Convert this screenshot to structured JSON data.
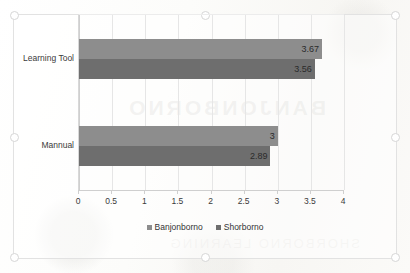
{
  "chart_data": {
    "type": "bar",
    "orientation": "horizontal",
    "title": "",
    "xlabel": "",
    "ylabel": "",
    "categories": [
      "Learning Tool",
      "Mannual"
    ],
    "series": [
      {
        "name": "Banjonborno",
        "values": [
          3.67,
          3
        ],
        "value_labels": [
          "3.67",
          "3"
        ],
        "color": "#8d8d8d"
      },
      {
        "name": "Shorborno",
        "values": [
          3.56,
          2.89
        ],
        "value_labels": [
          "3.56",
          "2.89"
        ],
        "color": "#6e6e6e"
      }
    ],
    "xlim": [
      0,
      4
    ],
    "xticks": [
      0,
      0.5,
      1,
      1.5,
      2,
      2.5,
      3,
      3.5,
      4
    ],
    "xtick_labels": [
      "0",
      "0.5",
      "1",
      "1.5",
      "2",
      "2.5",
      "3",
      "3.5",
      "4"
    ],
    "grid": true,
    "grid_axis": "x",
    "legend_position": "bottom"
  },
  "legend": {
    "items": [
      {
        "label": "Banjonborno",
        "color": "#8d8d8d"
      },
      {
        "label": "Shorborno",
        "color": "#6e6e6e"
      }
    ]
  },
  "artifacts": {
    "bleed_text": "BANJONBORNO",
    "bleed_text_2": "SHORBORNO LEARNING"
  }
}
